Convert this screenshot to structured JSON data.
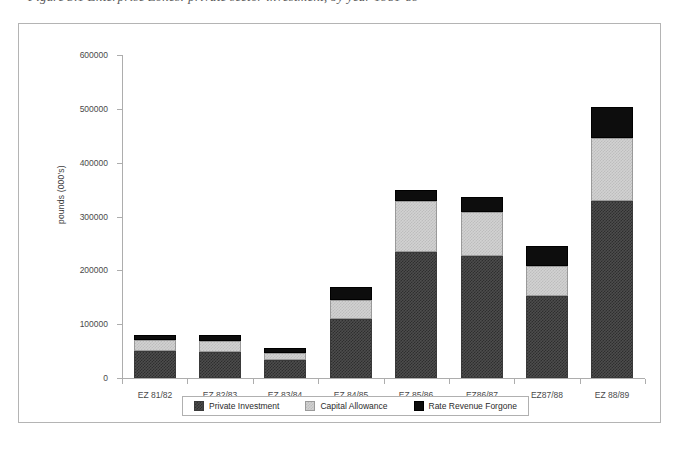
{
  "caption": {
    "text": "Figure 3.1   Enterprise Zones: private sector investment, by year 1981-89"
  },
  "chart_data": {
    "type": "bar",
    "subtype": "stacked",
    "title": "",
    "xlabel": "",
    "ylabel": "pounds (000's)",
    "ylim": [
      0,
      600000
    ],
    "yticks": [
      0,
      100000,
      200000,
      300000,
      400000,
      500000,
      600000
    ],
    "ytick_labels": [
      "0",
      "100000",
      "200000",
      "300000",
      "400000",
      "500000",
      "600000"
    ],
    "grid": false,
    "legend_position": "bottom",
    "categories": [
      "EZ 81/82",
      "EZ 82/83",
      "EZ 83/84",
      "EZ 84/85",
      "EZ 85/86",
      "EZ86/87",
      "EZ87/88",
      "EZ 88/89"
    ],
    "series": [
      {
        "name": "Private Investment",
        "color": "#3a3a3a",
        "values": [
          51000,
          49000,
          33000,
          110000,
          235000,
          227000,
          153000,
          328000
        ]
      },
      {
        "name": "Capital Allowance",
        "color": "#cccccc",
        "values": [
          20000,
          20000,
          14000,
          35000,
          94000,
          82000,
          55000,
          118000
        ]
      },
      {
        "name": "Rate Revenue Forgone",
        "color": "#000000",
        "values": [
          8000,
          10000,
          8000,
          24000,
          20000,
          28000,
          37000,
          57000
        ]
      }
    ],
    "totals": [
      79000,
      79000,
      55000,
      169000,
      349000,
      337000,
      245000,
      503000
    ]
  }
}
